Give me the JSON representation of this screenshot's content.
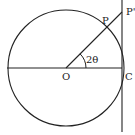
{
  "diagram": {
    "labels": {
      "center": "O",
      "point_on_circle": "P",
      "point_on_tangent": "P'",
      "tangent_point": "C",
      "angle": "2θ"
    },
    "stroke_color": "#222222",
    "background": "#ffffff"
  }
}
